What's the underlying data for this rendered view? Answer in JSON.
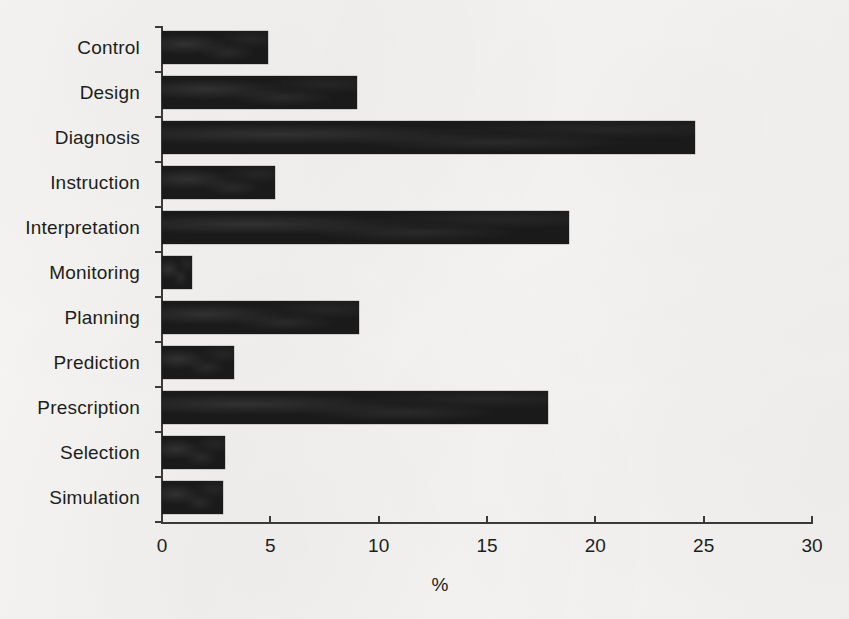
{
  "chart_data": {
    "type": "bar",
    "orientation": "horizontal",
    "title": "",
    "subtitle": "",
    "xlabel": "%",
    "ylabel": "",
    "xlim": [
      0,
      30
    ],
    "xticks": [
      "0",
      "5",
      "10",
      "15",
      "20",
      "25",
      "30"
    ],
    "grid": false,
    "legend": null,
    "categories": [
      "Control",
      "Design",
      "Diagnosis",
      "Instruction",
      "Interpretation",
      "Monitoring",
      "Planning",
      "Prediction",
      "Prescription",
      "Selection",
      "Simulation"
    ],
    "values": [
      4.9,
      9.0,
      24.6,
      5.2,
      18.8,
      1.4,
      9.1,
      3.3,
      17.8,
      2.9,
      2.8
    ],
    "bar_color": "#1a1a1a",
    "axis_color": "#3a3a3a",
    "background_color": "#f4f3f1"
  }
}
